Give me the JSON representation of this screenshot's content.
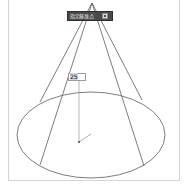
{
  "toolbar": {
    "label": "指定基准点",
    "icon": "square-options-icon",
    "background": "#4a4a4a"
  },
  "dimension_input": {
    "value": "25"
  },
  "drawing": {
    "shape": "cone",
    "apex": [
      92,
      3
    ],
    "base_ellipse": {
      "cx": 91,
      "cy": 135,
      "rx": 74,
      "ry": 43
    },
    "center_point": [
      79,
      142
    ],
    "line_color": "#5a5a5a"
  }
}
